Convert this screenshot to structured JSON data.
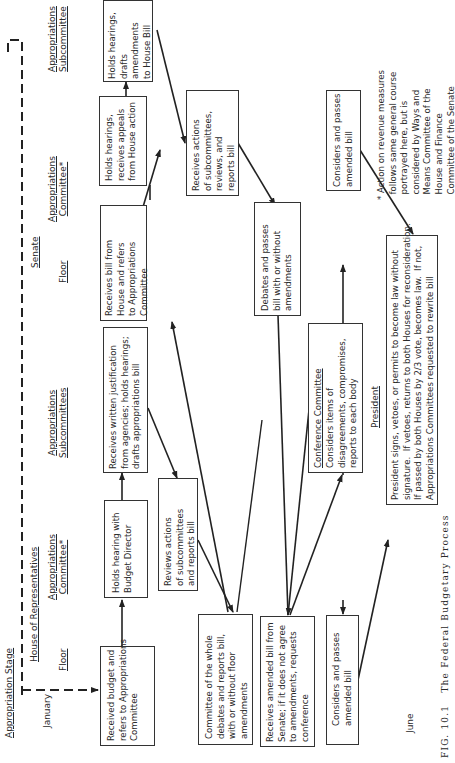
{
  "headers": {
    "stage": "Appropriation Stage",
    "house": "House of Representatives",
    "senate": "Senate",
    "house_floor": "Floor",
    "house_approp_committee": "Appropriations\nCommittee*",
    "house_approp_subcommittees": "Appropriations\nSubcommittees",
    "senate_floor": "Floor",
    "senate_approp_committee": "Appropriations\nCommittee*",
    "senate_approp_subcommittee": "Appropriations\nSubcommittee",
    "month_start": "January",
    "month_end": "June"
  },
  "boxes": {
    "h_floor_1": "Received budget and\nrefers to Appropriations\nCommittee",
    "h_committee_1": "Holds hearing with\nBudget Director",
    "h_subcommittees_1": "Receives written justification\nfrom agencies; holds hearings;\ndrafts appropriations bill",
    "h_committee_2": "Reviews actions\nof subcommittees\nand reports bill",
    "h_floor_2": "Committee of the whole\ndebates and reports bill,\nwith or without floor\namendments",
    "s_floor_1": "Receives bill from\nHouse and refers\nto Appropriations\nCommittee",
    "s_committee_1": "Holds hearings,\nreceives appeals\nfrom House action",
    "s_subcommittee_1": "Holds hearings,\ndrafts\namendments\nto House Bill",
    "s_committee_2": "Receives actions\nof subcommittees,\nreviews, and\nreports bill",
    "s_floor_2": "Debates and passes\nbill with or without\namendments",
    "h_floor_3": "Receives amended bill from\nSenate; if it does not agree\nto amendments, requests\nconference",
    "conference_title": "Conference Committee",
    "conference_body": "Considers items of\ndisagreements, compromises,\nreports to each body",
    "s_floor_3": "Considers and passes\namended bill",
    "h_floor_4": "Considers and passes\namended bill",
    "president_title": "President",
    "president_body": "President signs, vetoes, or permits to become law without\nsignature.  If vetoes, returns to both Houses for reconsideration.\nIf passed by both Houses by 2/3 vote, becomes law.  If not,\nAppropriations Committees requested to rewrite bill"
  },
  "footnote": "* Action on revenue measures\n  follows same general course\n  portrayed here, but is\n  considered by Ways and\n  Means Committee of the\n  House and Finance\n  Committee of the Senate",
  "caption": "FIG. 10.1   The Federal Budgetary Process"
}
